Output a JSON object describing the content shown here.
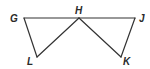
{
  "diagram": {
    "type": "geometry",
    "points": {
      "G": {
        "label": "G",
        "x": 24,
        "y": 18
      },
      "H": {
        "label": "H",
        "x": 79,
        "y": 18
      },
      "J": {
        "label": "J",
        "x": 135,
        "y": 18
      },
      "L": {
        "label": "L",
        "x": 37,
        "y": 57
      },
      "K": {
        "label": "K",
        "x": 121,
        "y": 57
      }
    },
    "segments": [
      "GJ",
      "GL",
      "LH",
      "HK",
      "KJ"
    ],
    "triangles": [
      "GHL",
      "HJK"
    ],
    "colors": {
      "stroke": "#333333",
      "label": "#2a2a2a",
      "background": "#ffffff"
    }
  }
}
